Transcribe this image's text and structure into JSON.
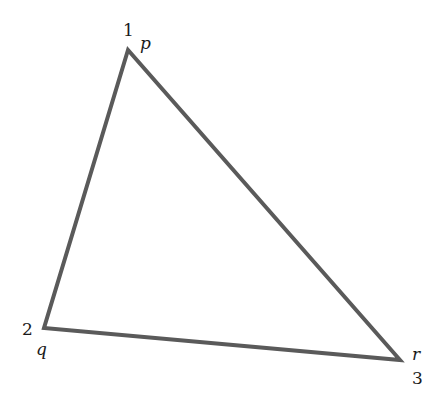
{
  "diagram": {
    "type": "triangle",
    "stroke_color": "#5a5a5a",
    "vertices": [
      {
        "index": "1",
        "name": "p",
        "x": 128,
        "y": 50
      },
      {
        "index": "2",
        "name": "q",
        "x": 44,
        "y": 328
      },
      {
        "index": "3",
        "name": "r",
        "x": 400,
        "y": 360
      }
    ],
    "points_attr": "128,50 44,328 400,360"
  }
}
